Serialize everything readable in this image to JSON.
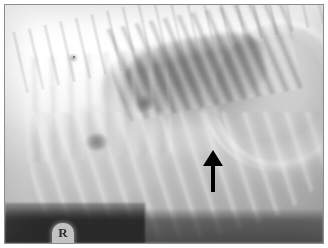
{
  "figure": {
    "kind": "radiograph",
    "modality": "X-ray",
    "view": "lateral thoracic",
    "border_color": "#8c8c8c",
    "background_color": "#ffffff"
  },
  "annotations": {
    "arrow": {
      "name": "pointer-arrow",
      "direction": "up",
      "color": "#000000",
      "x_percent": 60,
      "y_percent": 58,
      "description": "black arrow indicating focal region of interest"
    },
    "marker": {
      "name": "radiopaque-side-marker",
      "label": "R",
      "color": "#cfcfcf",
      "description": "radiopaque positional marker at caudoventral film edge"
    }
  },
  "regions": [
    {
      "name": "vertebral-column",
      "label": "Vertebral column",
      "opacity": "radiopaque"
    },
    {
      "name": "lung-field",
      "label": "Lung field",
      "opacity": "radiolucent"
    },
    {
      "name": "diaphragm-dome",
      "label": "Diaphragm",
      "opacity": "soft tissue"
    },
    {
      "name": "cardiac-silhouette",
      "label": "Cardiac silhouette",
      "opacity": "soft tissue"
    },
    {
      "name": "rib-arcs",
      "label": "Ribs",
      "opacity": "radiopaque"
    },
    {
      "name": "table-edge",
      "label": "Table edge",
      "opacity": "dark band"
    }
  ],
  "colors": {
    "film_light": "#f2f2f2",
    "film_mid": "#bdbdbd",
    "film_dark": "#2c2c2c",
    "arrow": "#000000",
    "frame": "#8c8c8c"
  }
}
